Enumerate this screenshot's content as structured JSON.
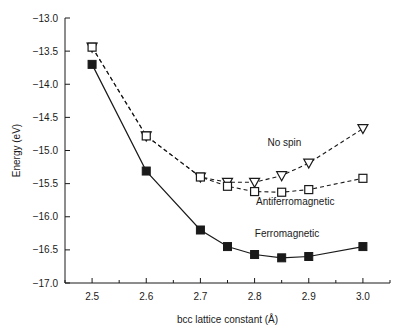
{
  "chart_data": {
    "type": "line",
    "title": "",
    "xlabel": "bcc lattice constant (Å)",
    "ylabel": "Energy (eV)",
    "xlim": [
      2.45,
      3.05
    ],
    "ylim": [
      -17.0,
      -13.0
    ],
    "grid": false,
    "legend_position": "inline-annotations",
    "xticks": [
      2.5,
      2.6,
      2.7,
      2.8,
      2.9,
      3.0
    ],
    "xtick_labels": [
      "2.5",
      "2.6",
      "2.7",
      "2.8",
      "2.9",
      "3.0"
    ],
    "xtick_minor_step": 0.05,
    "yticks": [
      -13.0,
      -13.5,
      -14.0,
      -14.5,
      -15.0,
      -15.5,
      -16.0,
      -16.5,
      -17.0
    ],
    "ytick_labels": [
      "−13.0",
      "−13.5",
      "−14.0",
      "−14.5",
      "−15.0",
      "−15.5",
      "−16.0",
      "−16.5",
      "−17.0"
    ],
    "series": [
      {
        "name": "No spin",
        "annotation": "No spin",
        "marker": "open-triangle-down",
        "linestyle": "dashed",
        "color": "#1a1a1a",
        "x": [
          2.5,
          2.6,
          2.7,
          2.75,
          2.8,
          2.85,
          2.9,
          3.0
        ],
        "values": [
          -13.44,
          -14.78,
          -15.4,
          -15.48,
          -15.48,
          -15.38,
          -15.19,
          -14.67
        ]
      },
      {
        "name": "Antiferromagnetic",
        "annotation": "Antiferromagnetic",
        "marker": "open-square",
        "linestyle": "dashed",
        "color": "#1a1a1a",
        "x": [
          2.5,
          2.6,
          2.7,
          2.75,
          2.8,
          2.85,
          2.9,
          3.0
        ],
        "values": [
          -13.44,
          -14.78,
          -15.4,
          -15.54,
          -15.62,
          -15.63,
          -15.59,
          -15.42
        ]
      },
      {
        "name": "Ferromagnetic",
        "annotation": "Ferromagnetic",
        "marker": "filled-square",
        "linestyle": "solid",
        "color": "#1a1a1a",
        "x": [
          2.5,
          2.6,
          2.7,
          2.75,
          2.8,
          2.85,
          2.9,
          3.0
        ],
        "values": [
          -13.7,
          -15.31,
          -16.2,
          -16.45,
          -16.57,
          -16.62,
          -16.6,
          -16.45
        ]
      }
    ],
    "annotations": [
      {
        "text": "No spin",
        "x": 2.855,
        "y": -14.93
      },
      {
        "text": "Antiferromagnetic",
        "x": 2.875,
        "y": -15.83
      },
      {
        "text": "Ferromagnetic",
        "x": 2.86,
        "y": -16.3
      }
    ]
  }
}
